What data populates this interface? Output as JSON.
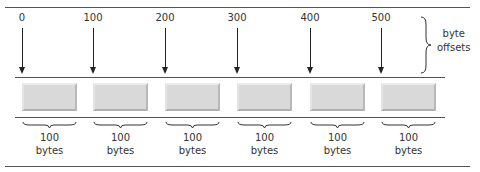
{
  "diagram": {
    "offsets": [
      {
        "label": "0",
        "x": 22
      },
      {
        "label": "100",
        "x": 93
      },
      {
        "label": "200",
        "x": 165
      },
      {
        "label": "300",
        "x": 237
      },
      {
        "label": "400",
        "x": 310
      },
      {
        "label": "500",
        "x": 381
      }
    ],
    "offset_group_label_line1": "byte",
    "offset_group_label_line2": "offsets",
    "blocks": [
      {
        "size_value": "100",
        "size_unit": "bytes"
      },
      {
        "size_value": "100",
        "size_unit": "bytes"
      },
      {
        "size_value": "100",
        "size_unit": "bytes"
      },
      {
        "size_value": "100",
        "size_unit": "bytes"
      },
      {
        "size_value": "100",
        "size_unit": "bytes"
      },
      {
        "size_value": "100",
        "size_unit": "bytes"
      }
    ],
    "colors": {
      "block_fill": "#d9d9d9",
      "line": "#555555",
      "text": "#333333"
    }
  }
}
